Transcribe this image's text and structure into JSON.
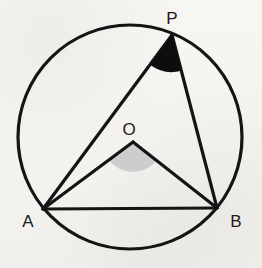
{
  "figure": {
    "background_color": "#f6f5f2",
    "stroke_color": "#141414",
    "canvas": {
      "width": 262,
      "height": 268
    }
  },
  "circle": {
    "name": "circumscribed-circle",
    "cx": 130,
    "cy": 137,
    "r": 112,
    "stroke_width": 3.2,
    "fill": "none"
  },
  "points": {
    "P": {
      "label": "P",
      "x": 172,
      "y": 35,
      "label_x": 172,
      "label_y": 24,
      "on_circle": true
    },
    "A": {
      "label": "A",
      "x": 43,
      "y": 209,
      "label_x": 28,
      "label_y": 227,
      "on_circle": true
    },
    "B": {
      "label": "B",
      "x": 217,
      "y": 208,
      "label_x": 236,
      "label_y": 227,
      "on_circle": true
    },
    "O": {
      "label": "O",
      "x": 133,
      "y": 142,
      "label_x": 129,
      "label_y": 135,
      "on_circle": false
    }
  },
  "segments": [
    {
      "name": "segment-PA",
      "from": "P",
      "to": "A",
      "stroke_width": 3.2
    },
    {
      "name": "segment-PB",
      "from": "P",
      "to": "B",
      "stroke_width": 3.2
    },
    {
      "name": "segment-OA",
      "from": "O",
      "to": "A",
      "stroke_width": 3.2
    },
    {
      "name": "segment-OB",
      "from": "O",
      "to": "B",
      "stroke_width": 3.2
    },
    {
      "name": "segment-AB",
      "from": "A",
      "to": "B",
      "stroke_width": 3.2
    }
  ],
  "angles": [
    {
      "name": "inscribed-angle-APB",
      "vertex": "P",
      "arms": [
        "A",
        "B"
      ],
      "fill": "#0d0d0d",
      "radius": 37,
      "path": "M 172 35 L 144.9 60.2 A 37 37 0 0 0 195.4 65.4 Z",
      "style": "solid-black-sector"
    },
    {
      "name": "central-angle-AOB",
      "vertex": "O",
      "arms": [
        "A",
        "B"
      ],
      "fill": "#cdcdcd",
      "radius": 30,
      "path": "M 133 142 L 109.9 161.1 A 30 30 0 0 0 162.6 160.2 Z",
      "style": "shaded-gray-sector"
    }
  ],
  "labels": {
    "P": "P",
    "A": "A",
    "B": "B",
    "O": "O"
  }
}
